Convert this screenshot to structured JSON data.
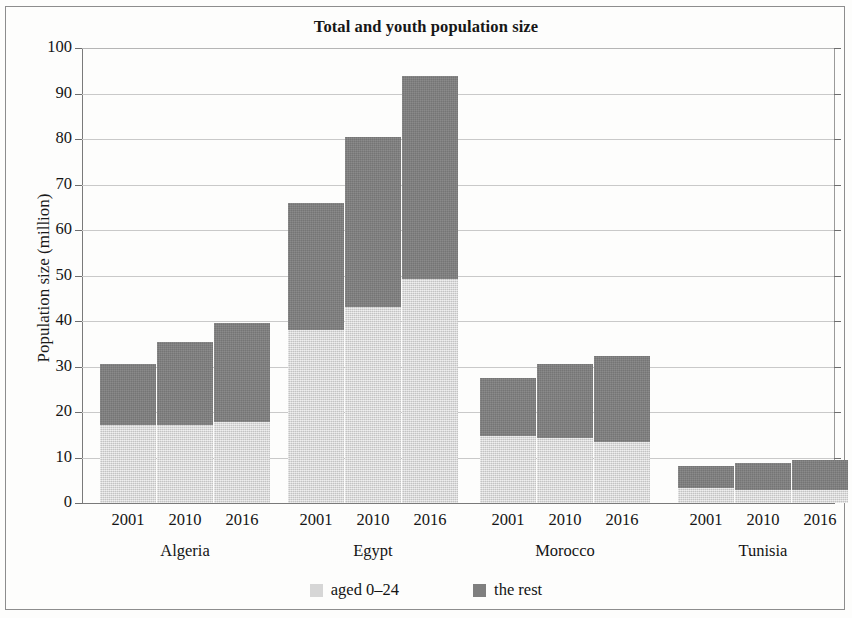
{
  "chart_data": {
    "type": "bar",
    "subtype": "stacked",
    "title": "Total and youth population size",
    "xlabel": "",
    "ylabel": "Population size (million)",
    "ylim": [
      0,
      100
    ],
    "ytick_step": 10,
    "yticks": [
      100,
      90,
      80,
      70,
      60,
      50,
      40,
      30,
      20,
      10,
      0
    ],
    "grid": true,
    "legend_position": "bottom",
    "groups": [
      "Algeria",
      "Egypt",
      "Morocco",
      "Tunisia"
    ],
    "categories": [
      "2001",
      "2010",
      "2016"
    ],
    "series": [
      {
        "name": "aged 0-24",
        "color": "#d6d6d6",
        "values": {
          "Algeria": [
            17.2,
            17.2,
            17.8
          ],
          "Egypt": [
            38.0,
            43.0,
            49.2
          ],
          "Morocco": [
            14.8,
            14.2,
            13.5
          ],
          "Tunisia": [
            3.2,
            2.9,
            2.9
          ]
        }
      },
      {
        "name": "the rest",
        "color": "#7f7f7f",
        "values": {
          "Algeria": [
            13.4,
            18.3,
            21.8
          ],
          "Egypt": [
            28.0,
            37.5,
            44.6
          ],
          "Morocco": [
            12.7,
            16.3,
            18.8
          ],
          "Tunisia": [
            5.0,
            5.9,
            6.5
          ]
        }
      }
    ],
    "totals": {
      "Algeria": [
        30.6,
        35.5,
        39.6
      ],
      "Egypt": [
        66.0,
        80.5,
        93.8
      ],
      "Morocco": [
        27.5,
        30.5,
        32.3
      ],
      "Tunisia": [
        8.2,
        8.8,
        9.4
      ]
    }
  },
  "legend": {
    "entries": [
      {
        "label": "aged 0–24",
        "swatch": "youth"
      },
      {
        "label": "the rest",
        "swatch": "rest"
      }
    ]
  },
  "axis": {
    "y_title": "Population size (million)",
    "y_labels": [
      "100",
      "90",
      "80",
      "70",
      "60",
      "50",
      "40",
      "30",
      "20",
      "10",
      "0"
    ]
  },
  "x_labels": {
    "years": [
      "2001",
      "2010",
      "2016"
    ],
    "countries": [
      "Algeria",
      "Egypt",
      "Morocco",
      "Tunisia"
    ]
  }
}
